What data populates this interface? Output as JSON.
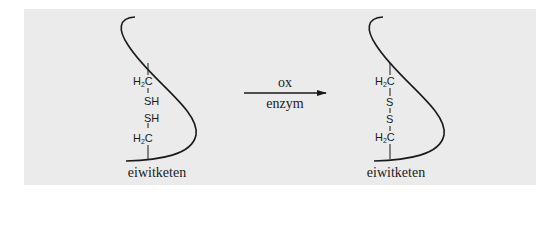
{
  "diagram": {
    "type": "chemical-reaction",
    "background_color": "#ebebeb",
    "stroke_color": "#1a1a1a",
    "reactant": {
      "chain_label": "eiwitketen",
      "groups": [
        {
          "prefix": "H",
          "sub": "2",
          "suffix": "C"
        },
        {
          "text": "SH"
        },
        {
          "text": "SH"
        },
        {
          "prefix": "H",
          "sub": "2",
          "suffix": "C"
        }
      ]
    },
    "arrow": {
      "above": "ox",
      "below": "enzym"
    },
    "product": {
      "chain_label": "eiwitketen",
      "groups": [
        {
          "prefix": "H",
          "sub": "2",
          "suffix": "C"
        },
        {
          "text": "S"
        },
        {
          "text": "S"
        },
        {
          "prefix": "H",
          "sub": "2",
          "suffix": "C"
        }
      ]
    }
  }
}
